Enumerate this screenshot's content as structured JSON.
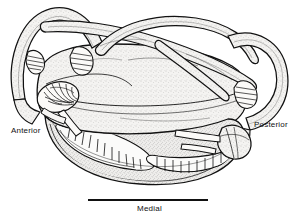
{
  "figure": {
    "kind": "anatomical-line-drawing",
    "view": "lateral",
    "background_color": "#ffffff",
    "ink_color": "#111111",
    "stipple_color": "#8d8d8d",
    "fill_color": "#f2f1ef"
  },
  "labels": {
    "anterior": "Anterior",
    "posterior": "Posterior",
    "medial": "Medial"
  },
  "scale_bar": {
    "visible": true,
    "x": 88,
    "y": 199,
    "width": 120,
    "height": 2,
    "caption": "Medial"
  },
  "structures": [
    {
      "name": "anterior-semicircular-canal",
      "type": "canal-loop",
      "side": "anterior"
    },
    {
      "name": "posterior-semicircular-canal",
      "type": "canal-loop",
      "side": "posterior"
    },
    {
      "name": "horizontal-semicircular-canal",
      "type": "canal-loop",
      "side": "lateral"
    },
    {
      "name": "anterior-ampulla-crista",
      "type": "ampulla",
      "pattern": "radial-fan"
    },
    {
      "name": "posterior-ampulla-crista",
      "type": "ampulla",
      "pattern": "hatched"
    },
    {
      "name": "lateral-ampulla-crista",
      "type": "ampulla",
      "pattern": "hatched"
    },
    {
      "name": "utricle",
      "type": "otolith-organ"
    },
    {
      "name": "saccule",
      "type": "otolith-organ"
    },
    {
      "name": "lagena",
      "type": "otolith-organ"
    },
    {
      "name": "basilar-papilla",
      "type": "sensory-epithelium",
      "pattern": "hair-cell-rows"
    },
    {
      "name": "cochlear-duct",
      "type": "duct"
    }
  ]
}
